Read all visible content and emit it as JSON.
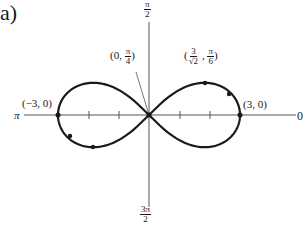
{
  "figure": {
    "part_label": "a)",
    "curve_equation": "r^2 = 9 cos(2θ)",
    "axis_labels": {
      "right": "0",
      "left": "π",
      "top": {
        "num": "π",
        "den": "2"
      },
      "bottom": {
        "num": "3π",
        "den": "2"
      }
    },
    "point_labels": {
      "right_vertex": "(3, 0)",
      "left_vertex": "(−3, 0)",
      "origin_tangent": {
        "prefix": "(0, ",
        "num": "π",
        "den": "4",
        "suffix": ")"
      },
      "upper_point": {
        "prefix": "(",
        "num": "3",
        "den": "√2",
        "mid": " , ",
        "num2": "π",
        "den2": "6",
        "suffix": ")"
      }
    },
    "colors": {
      "curve": "#1a1a1a",
      "axis": "#555555"
    }
  }
}
